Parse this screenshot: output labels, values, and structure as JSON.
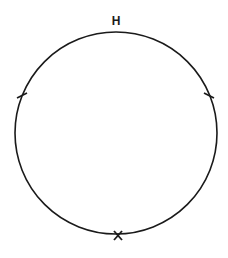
{
  "diagram": {
    "type": "circle-with-markers",
    "stroke_color": "#1a1a1a",
    "background": "#ffffff",
    "circle": {
      "cx": 116,
      "cy": 133,
      "r": 101
    },
    "top_label": {
      "text": "H",
      "x": 116,
      "y": 25
    },
    "bottom_marker": {
      "text": "X",
      "x": 118,
      "y": 236
    },
    "tick_marks": [
      {
        "name": "left-tick",
        "x": 22,
        "y": 96
      },
      {
        "name": "right-tick",
        "x": 209,
        "y": 96
      }
    ]
  }
}
